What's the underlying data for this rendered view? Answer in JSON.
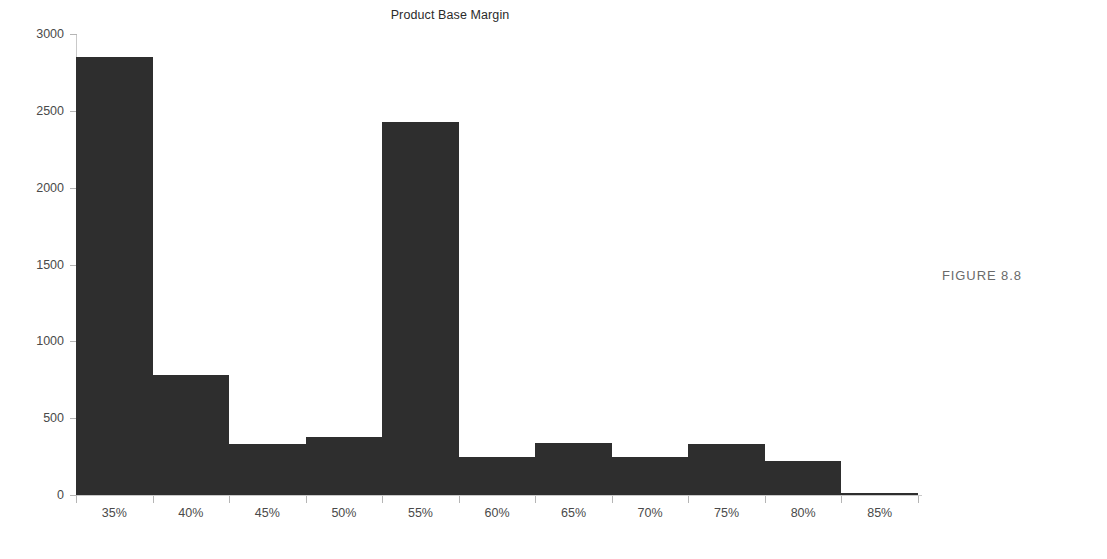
{
  "figure": {
    "caption": "FIGURE 8.8"
  },
  "chart_data": {
    "type": "bar",
    "title": "Product Base Margin",
    "xlabel": "",
    "ylabel": "",
    "categories": [
      "35%",
      "40%",
      "45%",
      "50%",
      "55%",
      "60%",
      "65%",
      "70%",
      "75%",
      "80%",
      "85%"
    ],
    "values": [
      2850,
      780,
      330,
      375,
      2430,
      250,
      340,
      250,
      330,
      220,
      15
    ],
    "ylim": [
      0,
      3000
    ],
    "yticks": [
      0,
      500,
      1000,
      1500,
      2000,
      2500,
      3000
    ],
    "ytick_labels": [
      "0",
      "500",
      "1000",
      "1500",
      "2000",
      "2500",
      "3000"
    ],
    "xtick_labels": [
      "35%",
      "40%",
      "45%",
      "50%",
      "55%",
      "60%",
      "65%",
      "70%",
      "75%",
      "80%",
      "85%"
    ],
    "grid": false,
    "legend": null,
    "bar_color": "#2e2e2e",
    "axis_color": "#c9c9c9",
    "text_color": "#4a4a4a"
  }
}
